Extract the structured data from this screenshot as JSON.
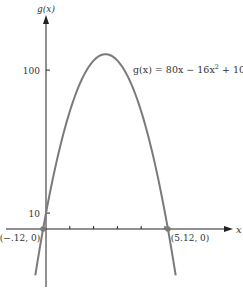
{
  "chart_data": {
    "type": "line",
    "title": "",
    "function_label": "g(x) = 80x − 16x² + 10",
    "function_label_parts": {
      "lhs": "g(x) = 80x − 16x",
      "exp": "2",
      "rhs": " + 10"
    },
    "xlabel": "x",
    "ylabel": "g(x)",
    "coefficients": {
      "a": -16,
      "b": 80,
      "c": 10
    },
    "x_ticks": [
      1,
      2,
      3,
      4,
      5
    ],
    "y_ticks": [
      {
        "value": 10,
        "label": "10"
      },
      {
        "value": 100,
        "label": "100"
      }
    ],
    "domain": [
      -0.45,
      5.45
    ],
    "series": [
      {
        "name": "g(x)",
        "x": [
          -0.12,
          0,
          0.5,
          1,
          1.5,
          2,
          2.5,
          3,
          3.5,
          4,
          4.5,
          5,
          5.12
        ],
        "values": [
          0,
          10,
          46,
          74,
          94,
          106,
          110,
          106,
          94,
          74,
          46,
          10,
          0
        ]
      }
    ],
    "points": [
      {
        "x": -0.12,
        "y": 0,
        "label": "(−.12, 0)"
      },
      {
        "x": 5.12,
        "y": 0,
        "label": "(5.12, 0)"
      }
    ],
    "vertex": {
      "x": 2.5,
      "y": 110
    },
    "grid": false,
    "colors": {
      "curve": "#7a7a7a",
      "axis": "#222222",
      "point": "#7a7a7a"
    }
  },
  "layout": {
    "origin_px": {
      "x": 46,
      "y": 229
    },
    "x_scale_px": 23.8,
    "y_scale_px": 1.589
  }
}
